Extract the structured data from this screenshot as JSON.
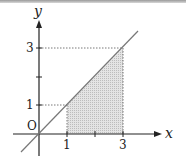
{
  "figure": {
    "type": "coordinate-diagram",
    "axes": {
      "x_label": "x",
      "y_label": "y",
      "origin_label": "O"
    },
    "x_ticks": [
      {
        "value": 1,
        "label": "1"
      },
      {
        "value": 2,
        "label": ""
      },
      {
        "value": 3,
        "label": "3"
      }
    ],
    "y_ticks": [
      {
        "value": 1,
        "label": "1"
      },
      {
        "value": 2,
        "label": ""
      },
      {
        "value": 3,
        "label": "3"
      }
    ],
    "line": {
      "equation": "y = x"
    },
    "shaded_region": {
      "description": "region under y = x between x = 1 and x = 3",
      "x_from": 1,
      "x_to": 3
    },
    "guides": [
      {
        "from": [
          0,
          1
        ],
        "to": [
          1,
          1
        ]
      },
      {
        "from": [
          1,
          0
        ],
        "to": [
          1,
          1
        ]
      },
      {
        "from": [
          0,
          3
        ],
        "to": [
          3,
          3
        ]
      },
      {
        "from": [
          3,
          0
        ],
        "to": [
          3,
          3
        ]
      }
    ],
    "colors": {
      "axis": "#222222",
      "line": "#777777",
      "shade": "#d9d9d9",
      "guide": "#555555"
    }
  }
}
